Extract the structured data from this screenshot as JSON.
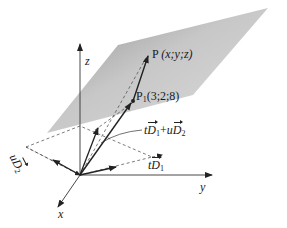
{
  "diagram": {
    "type": "3d-vector-plane",
    "axes": {
      "x_label": "x",
      "y_label": "y",
      "z_label": "z"
    },
    "points": {
      "P": {
        "name": "P",
        "coords_text": "(x;y;z)"
      },
      "P1": {
        "name": "P",
        "subscript": "1",
        "coords_text": "(3;2;8)"
      }
    },
    "vectors": {
      "tD1": {
        "scalar": "t",
        "vec": "D",
        "subscript": "1"
      },
      "uD2": {
        "scalar": "u",
        "vec": "D",
        "subscript": "2"
      },
      "sum": {
        "t": "t",
        "u": "u",
        "plus": "+",
        "d": "D",
        "sub1": "1",
        "sub2": "2"
      }
    },
    "colors": {
      "plane_light": "#e6e6e6",
      "plane_dark": "#a9a9a9",
      "lines": "#222222"
    }
  }
}
